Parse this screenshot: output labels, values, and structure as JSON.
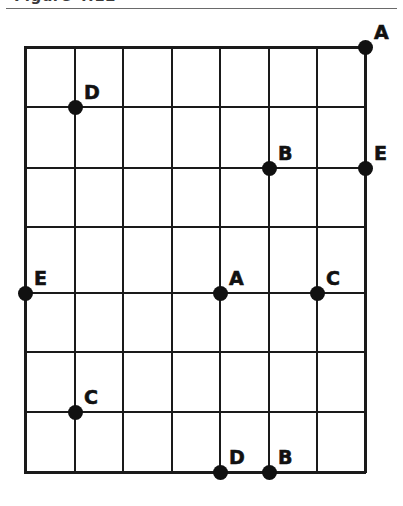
{
  "page": {
    "width": 403,
    "height": 506,
    "background_color": "#ffffff",
    "ink_color": "#111111"
  },
  "header": {
    "clipped_text": "Figure  4.12",
    "rule_color": "#6a6a6a"
  },
  "chart_data": {
    "type": "scatter",
    "title": "",
    "xlabel": "",
    "ylabel": "",
    "grid": true,
    "legend_position": "none",
    "axis_style": "lattice",
    "x_columns": 7,
    "y_rows": 7,
    "xlim": [
      0,
      7
    ],
    "ylim": [
      0,
      7
    ],
    "grid_geometry": {
      "left": 25,
      "top": 47,
      "right": 365,
      "bottom": 472,
      "vertical_lines_x": [
        25,
        75,
        123,
        172,
        220,
        269,
        317,
        365
      ],
      "horizontal_lines_y": [
        47,
        107,
        168,
        227,
        293,
        352,
        412,
        472
      ],
      "line_color": "#1a1a1a",
      "line_width": 2
    },
    "point_radius_px": 7.5,
    "label_offset": {
      "dx": 9,
      "dy": -24
    },
    "points": [
      {
        "label": "A",
        "col": 7,
        "row": 0,
        "x": 365,
        "y": 47,
        "grid_x": 7,
        "grid_y": 7
      },
      {
        "label": "D",
        "col": 1,
        "row": 1,
        "x": 75,
        "y": 107,
        "grid_x": 1,
        "grid_y": 6
      },
      {
        "label": "B",
        "col": 5,
        "row": 2,
        "x": 269,
        "y": 168,
        "grid_x": 5,
        "grid_y": 5
      },
      {
        "label": "E",
        "col": 7,
        "row": 2,
        "x": 365,
        "y": 168,
        "grid_x": 7,
        "grid_y": 5
      },
      {
        "label": "E",
        "col": 0,
        "row": 4,
        "x": 25,
        "y": 293,
        "grid_x": 0,
        "grid_y": 3
      },
      {
        "label": "A",
        "col": 4,
        "row": 4,
        "x": 220,
        "y": 293,
        "grid_x": 4,
        "grid_y": 3
      },
      {
        "label": "C",
        "col": 6,
        "row": 4,
        "x": 317,
        "y": 293,
        "grid_x": 6,
        "grid_y": 3
      },
      {
        "label": "C",
        "col": 1,
        "row": 5,
        "x": 75,
        "y": 412,
        "grid_x": 1,
        "grid_y": 2
      },
      {
        "label": "D",
        "col": 4,
        "row": 7,
        "x": 220,
        "y": 472,
        "grid_x": 4,
        "grid_y": 0
      },
      {
        "label": "B",
        "col": 5,
        "row": 7,
        "x": 269,
        "y": 472,
        "grid_x": 5,
        "grid_y": 0
      }
    ],
    "label_series": [
      "A",
      "B",
      "C",
      "D",
      "E"
    ]
  }
}
